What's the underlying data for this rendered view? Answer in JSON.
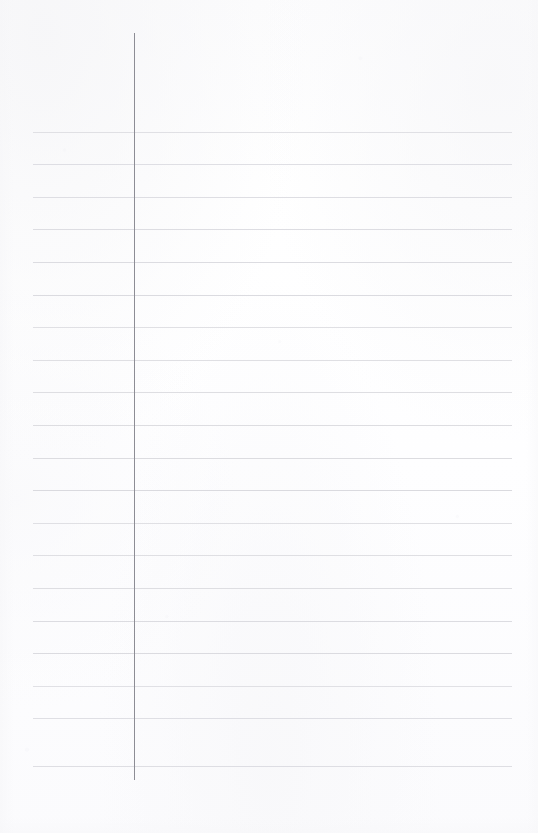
{
  "page": {
    "kind": "ruled-notebook-paper",
    "width": 538,
    "height": 833,
    "background_color": "#fdfdfe",
    "content_text": ""
  },
  "margin_line": {
    "name": "vertical-margin-rule",
    "color": "#8d8d95",
    "x": 134,
    "y_start": 33,
    "y_end": 780,
    "thickness": 1.4
  },
  "ruling": {
    "color": "#d9d9de",
    "thickness": 1,
    "x_start": 33,
    "x_end": 512,
    "spacing": 32.6,
    "count": 20,
    "line_y": [
      131.5,
      164.1,
      196.7,
      229.3,
      261.9,
      294.5,
      327.1,
      359.7,
      392.3,
      424.9,
      457.5,
      490.1,
      522.7,
      555.3,
      587.9,
      620.5,
      653.1,
      685.7,
      718.3,
      765.5
    ]
  },
  "writing_area": {
    "name": "blank-writing-area",
    "label": "",
    "is_empty": true
  }
}
